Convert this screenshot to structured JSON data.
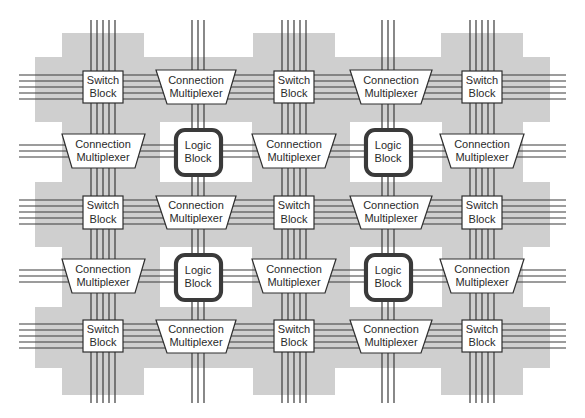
{
  "diagram": {
    "labels": {
      "switch_line1": "Switch",
      "switch_line2": "Block",
      "mux_line1": "Connection",
      "mux_line2": "Multiplexer",
      "logic_line1": "Logic",
      "logic_line2": "Block"
    },
    "colors": {
      "background_shade": "#cfcfcf",
      "wire": "#3a3a3a",
      "block_fill": "#ffffff",
      "block_stroke": "#2e2e2e"
    },
    "grid": {
      "columns": 5,
      "rows": 5,
      "column_centers_x": [
        103,
        196,
        294,
        391,
        482
      ],
      "row_centers_y": [
        87,
        151,
        212,
        276,
        336
      ]
    },
    "cells": [
      [
        "Switch Block",
        "Connection Multiplexer",
        "Switch Block",
        "Connection Multiplexer",
        "Switch Block"
      ],
      [
        "Connection Multiplexer",
        "Logic Block",
        "Connection Multiplexer",
        "Logic Block",
        "Connection Multiplexer"
      ],
      [
        "Switch Block",
        "Connection Multiplexer",
        "Switch Block",
        "Connection Multiplexer",
        "Switch Block"
      ],
      [
        "Connection Multiplexer",
        "Logic Block",
        "Connection Multiplexer",
        "Logic Block",
        "Connection Multiplexer"
      ],
      [
        "Switch Block",
        "Connection Multiplexer",
        "Switch Block",
        "Connection Multiplexer",
        "Switch Block"
      ]
    ],
    "counts": {
      "switch_blocks": 9,
      "connection_multiplexers": 12,
      "logic_blocks": 4,
      "routing_channel_wires": 5,
      "logic_connection_wires": 3
    }
  }
}
